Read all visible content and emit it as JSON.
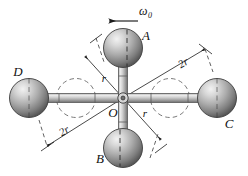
{
  "figure": {
    "background_color": "#ffffff",
    "stroke_color": "#1a1a1a",
    "sphere_fill_light": "#e8e8e8",
    "sphere_fill_mid": "#9a9a9a",
    "sphere_fill_dark": "#5c5c5c",
    "rod_fill_light": "#e2e2e2",
    "rod_fill_mid": "#b0b0b0",
    "dash_color": "#555555"
  },
  "labels": {
    "sphere_a": "A",
    "sphere_b": "B",
    "sphere_c": "C",
    "sphere_d": "D",
    "center": "O",
    "omega": "ω",
    "omega_sub": "0",
    "radius_upper_left": "r",
    "radius_lower_right": "r",
    "dim_top_right": "2r",
    "dim_bottom_left": "2r"
  },
  "geometry": {
    "center": {
      "x": 123,
      "y": 98
    },
    "sphere_radius": 19,
    "spheres": [
      {
        "name": "A",
        "cx": 123,
        "cy": 48
      },
      {
        "name": "B",
        "cx": 123,
        "cy": 148
      },
      {
        "name": "C",
        "cx": 217,
        "cy": 98
      },
      {
        "name": "D",
        "cx": 29,
        "cy": 98
      }
    ],
    "ghost_circles": [
      {
        "cx": 76,
        "cy": 98,
        "r": 19
      },
      {
        "cx": 170,
        "cy": 98,
        "r": 19
      }
    ],
    "arm_half_length_vertical": 50,
    "arm_half_length_horizontal": 94
  },
  "annotations": {
    "omega_arrow_direction": "left",
    "omega_arrow_x_start": 137,
    "omega_arrow_x_end": 110,
    "omega_arrow_y": 20
  }
}
